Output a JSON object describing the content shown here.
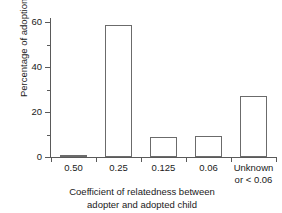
{
  "chart_data": {
    "type": "bar",
    "title": "",
    "subtitle": "",
    "categories": [
      "0.50",
      "0.25",
      "0.125",
      "0.06",
      "Unknown or < 0.06"
    ],
    "category_labels": [
      {
        "line1": "0.50",
        "line2": ""
      },
      {
        "line1": "0.25",
        "line2": ""
      },
      {
        "line1": "0.125",
        "line2": ""
      },
      {
        "line1": "0.06",
        "line2": ""
      },
      {
        "line1": "Unknown",
        "line2": "or < 0.06"
      }
    ],
    "values": [
      1,
      59,
      9,
      9.5,
      27
    ],
    "xlabel": "Coefficient of relatedness between adopter and adopted child",
    "xlabel_lines": [
      "Coefficient of relatedness between",
      "adopter and adopted child"
    ],
    "ylabel": "Percentage of adoptions",
    "ylim": [
      0,
      62
    ],
    "ytick_values": [
      0,
      20,
      40,
      60
    ],
    "ytick_labels": [
      "0",
      "20",
      "40",
      "60"
    ],
    "yminor_values": [
      10,
      30,
      50
    ],
    "grid": false,
    "legend": null,
    "bar_style": "outlined",
    "colors": {
      "background": "#ffffff",
      "bar_edge": "#6b6b6b",
      "bar_fill": "transparent",
      "axis": "#5a5a5a",
      "text": "#1a1a1a"
    }
  }
}
